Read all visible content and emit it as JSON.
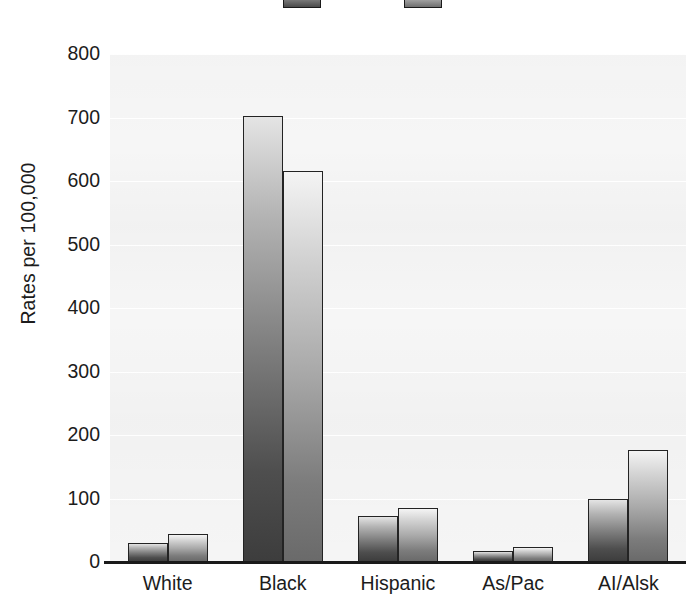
{
  "chart_data": {
    "type": "bar",
    "title": "",
    "xlabel": "",
    "ylabel": "Rates per 100,000",
    "ylim": [
      0,
      800
    ],
    "ytick_labels": [
      "800",
      "700",
      "600",
      "500",
      "400",
      "300",
      "200",
      "100",
      "0"
    ],
    "ytick_values": [
      800,
      700,
      600,
      500,
      400,
      300,
      200,
      100,
      0
    ],
    "grid": true,
    "legend_position": "top-center",
    "categories": [
      "White",
      "Black",
      "Hispanic",
      "As/Pac",
      "AI/Alsk"
    ],
    "series": [
      {
        "name": "Series 1",
        "color": "#4e4e4e",
        "values": [
          30,
          703,
          72,
          18,
          100
        ]
      },
      {
        "name": "Series 2",
        "color": "#8c8c8c",
        "values": [
          44,
          615,
          85,
          23,
          176
        ]
      }
    ]
  },
  "legend": {
    "items": [
      {
        "label": "",
        "swatch": "series-1-swatch"
      },
      {
        "label": "",
        "swatch": "series-2-swatch"
      }
    ]
  }
}
